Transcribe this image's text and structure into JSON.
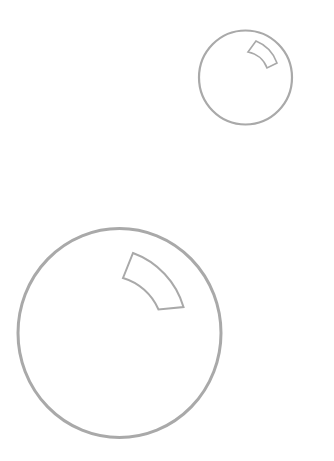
{
  "canvas": {
    "width": 334,
    "height": 461,
    "background": "#ffffff"
  },
  "colors": {
    "stroke": "#a9a9a9",
    "highlight_stroke": "#a9a9a9",
    "fill": "#ffffff"
  },
  "bubbles": [
    {
      "name": "small-bubble",
      "cx": 245.5,
      "cy": 77.5,
      "rx": 46.5,
      "ry": 47,
      "stroke_width": 2.2,
      "highlight_path": "M256,41 A37,37 0 0 1 277,63 L267,68 A25,25 0 0 0 248,52 Z",
      "highlight_stroke_width": 1.6
    },
    {
      "name": "large-bubble",
      "cx": 119.5,
      "cy": 333,
      "rx": 101.5,
      "ry": 104.5,
      "stroke_width": 3,
      "highlight_path": "M133,253 A82,82 0 0 1 183.5,307 L158.5,309.5 A56,56 0 0 0 123,278 Z",
      "highlight_stroke_width": 2
    }
  ]
}
